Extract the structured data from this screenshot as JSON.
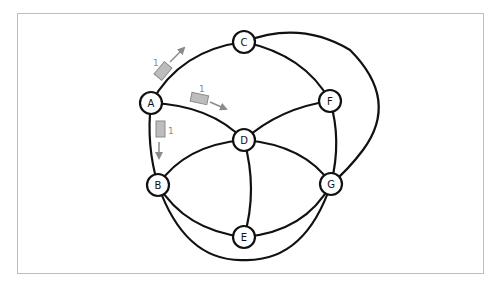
{
  "diagram": {
    "type": "network-graph",
    "nodes": [
      {
        "id": "A",
        "label": "A",
        "x": 151,
        "y": 103
      },
      {
        "id": "B",
        "label": "B",
        "x": 158,
        "y": 185
      },
      {
        "id": "C",
        "label": "C",
        "x": 244,
        "y": 42
      },
      {
        "id": "D",
        "label": "D",
        "x": 244,
        "y": 140
      },
      {
        "id": "E",
        "label": "E",
        "x": 244,
        "y": 237
      },
      {
        "id": "F",
        "label": "F",
        "x": 330,
        "y": 101
      },
      {
        "id": "G",
        "label": "G",
        "x": 331,
        "y": 184
      }
    ],
    "edges": [
      [
        "A",
        "C"
      ],
      [
        "A",
        "D"
      ],
      [
        "A",
        "B"
      ],
      [
        "C",
        "F"
      ],
      [
        "C",
        "G"
      ],
      [
        "F",
        "D"
      ],
      [
        "F",
        "G"
      ],
      [
        "D",
        "B"
      ],
      [
        "D",
        "E"
      ],
      [
        "D",
        "G"
      ],
      [
        "B",
        "E"
      ],
      [
        "E",
        "G"
      ],
      [
        "B",
        "G"
      ]
    ],
    "packets": [
      {
        "label": "1",
        "from": "A",
        "to": "C"
      },
      {
        "label": "1",
        "from": "A",
        "to": "D"
      },
      {
        "label": "1",
        "from": "A",
        "to": "B"
      }
    ]
  },
  "colors": {
    "edge": "#111111",
    "packet_fill": "#bdbdbd",
    "arrow": "#8a8a8a",
    "frame": "#bdbdbd"
  }
}
